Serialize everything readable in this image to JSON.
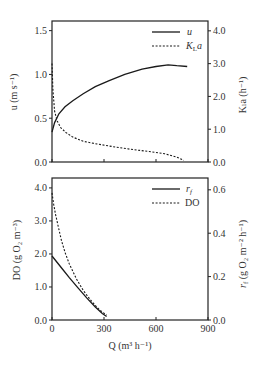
{
  "chart_data": [
    {
      "type": "line",
      "panel": "top",
      "title": "",
      "xlabel": "",
      "xlim": [
        0,
        900
      ],
      "xticks": [
        0,
        300,
        600,
        900
      ],
      "xtick_labels_shown": false,
      "ylabel_left": "u (m s⁻¹)",
      "ylim_left": [
        0,
        1.61
      ],
      "yticks_left": [
        "0.0",
        "0.5",
        "1.0",
        "1.5"
      ],
      "ylabel_right": "Kₗa (h⁻¹)",
      "ylim_right": [
        0,
        4.3
      ],
      "yticks_right": [
        "0.0",
        "1.0",
        "2.0",
        "3.0",
        "4.0"
      ],
      "legend_position": "upper right",
      "grid": false,
      "series": [
        {
          "name": "u",
          "style": "solid",
          "axis": "left",
          "x": [
            0,
            15,
            40,
            75,
            120,
            180,
            250,
            330,
            420,
            520,
            600,
            670,
            720,
            780
          ],
          "y": [
            0.34,
            0.45,
            0.55,
            0.63,
            0.7,
            0.78,
            0.86,
            0.93,
            1.0,
            1.06,
            1.09,
            1.11,
            1.1,
            1.09
          ]
        },
        {
          "name": "K_La",
          "style": "dotted",
          "axis": "right",
          "x": [
            0,
            5,
            15,
            30,
            50,
            80,
            120,
            180,
            260,
            350,
            450,
            560,
            650,
            720,
            760
          ],
          "y": [
            3.0,
            2.2,
            1.55,
            1.25,
            1.05,
            0.9,
            0.76,
            0.63,
            0.55,
            0.47,
            0.39,
            0.32,
            0.25,
            0.15,
            0.05
          ]
        }
      ]
    },
    {
      "type": "line",
      "panel": "bottom",
      "title": "",
      "xlabel": "Q (m³ h⁻¹)",
      "xlim": [
        0,
        900
      ],
      "xticks": [
        "0",
        "300",
        "600",
        "900"
      ],
      "ylabel_left": "DO (g O₂ m⁻³)",
      "ylim_left": [
        0,
        4.3
      ],
      "yticks_left": [
        "0.0",
        "1.0",
        "2.0",
        "3.0",
        "4.0"
      ],
      "ylabel_right": "r_f (g O₂ m⁻² h⁻¹)",
      "ylim_right": [
        0,
        0.6545
      ],
      "yticks_right": [
        "0.0",
        "0.2",
        "0.4",
        "0.6"
      ],
      "legend_position": "upper right",
      "grid": false,
      "series": [
        {
          "name": "r_f",
          "style": "solid",
          "axis": "right",
          "x": [
            0,
            30,
            60,
            100,
            150,
            200,
            250,
            290,
            315
          ],
          "y": [
            0.295,
            0.265,
            0.235,
            0.195,
            0.148,
            0.102,
            0.06,
            0.03,
            0.016
          ]
        },
        {
          "name": "DO",
          "style": "dotted",
          "axis": "left",
          "x": [
            0,
            10,
            20,
            35,
            55,
            75,
            100,
            140,
            180,
            220,
            260,
            290,
            315
          ],
          "y": [
            3.85,
            3.5,
            3.2,
            2.85,
            2.4,
            2.05,
            1.7,
            1.25,
            0.9,
            0.62,
            0.38,
            0.24,
            0.15
          ]
        }
      ]
    }
  ],
  "labels": {
    "top_ylabel_left": "u (m s⁻¹)",
    "top_ylabel_right": "Kₗa (h⁻¹)",
    "top_legend_u": "u",
    "top_legend_kla_K": "K",
    "top_legend_kla_L": "L",
    "top_legend_kla_a": "a",
    "bottom_ylabel_left": "DO (g O₂ m⁻³)",
    "bottom_ylabel_right_r": "r",
    "bottom_ylabel_right_f": "f",
    "bottom_ylabel_right_rest": " (g O₂ m⁻² h⁻¹)",
    "bottom_legend_rf_r": "r",
    "bottom_legend_rf_f": "f",
    "bottom_legend_do": "DO",
    "xlabel": "Q (m³ h⁻¹)"
  }
}
